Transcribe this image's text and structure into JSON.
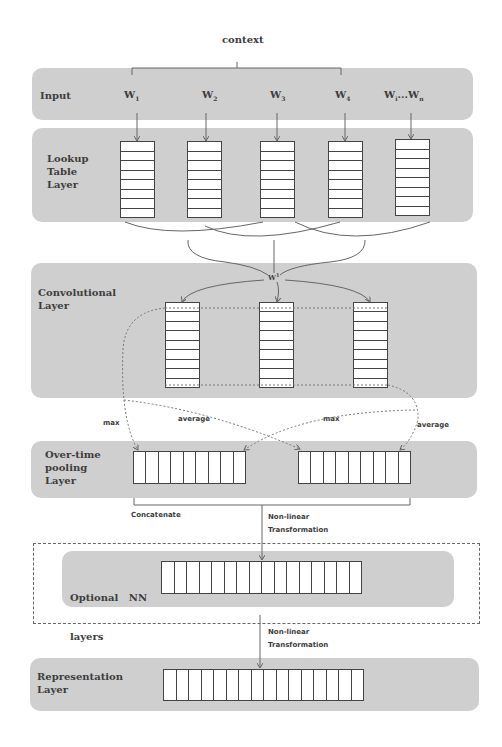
{
  "diagram": {
    "context_label": "context",
    "layers": {
      "input": {
        "label": "Input",
        "words": [
          "W1",
          "W2",
          "W3",
          "W4",
          "Wi...Wn"
        ]
      },
      "lookup": {
        "label_lines": [
          "Lookup",
          "Table",
          "Layer"
        ],
        "columns": 5,
        "rows_per_column": 8
      },
      "convolutional": {
        "label_lines": [
          "Convolutional",
          "Layer"
        ],
        "weight_label": "W",
        "weight_sup": "1",
        "columns": 3,
        "rows_per_column": 9
      },
      "pooling": {
        "label_lines": [
          "Over-time",
          "pooling",
          "Layer"
        ],
        "vectors": 2,
        "cells_per_vector": 9,
        "edge_labels": [
          "max",
          "average",
          "max",
          "average"
        ]
      },
      "optional": {
        "label_lines": [
          "Optional   NN",
          "layers"
        ],
        "cells": 16
      },
      "representation": {
        "label_lines": [
          "Representation",
          "Layer"
        ],
        "cells": 16
      }
    },
    "annotations": {
      "concatenate": "Concatenate",
      "nonlinear_1_lines": [
        "Non-linear",
        "Transformation"
      ],
      "nonlinear_2_lines": [
        "Non-linear",
        "Transformation"
      ]
    },
    "colors": {
      "layer_fill": "#cfcfcf",
      "line": "#666666",
      "cell_border": "#444444"
    }
  }
}
